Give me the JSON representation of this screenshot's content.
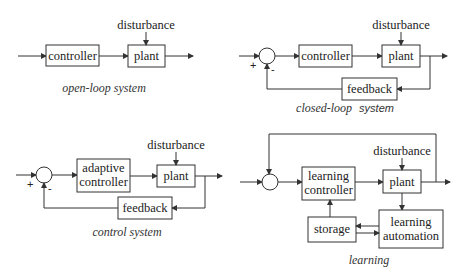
{
  "diagrams": {
    "open_loop": {
      "caption": "open-loop system",
      "blocks": {
        "controller": "controller",
        "plant": "plant"
      },
      "disturbance": "disturbance"
    },
    "closed_loop": {
      "caption_a": "closed-loop",
      "caption_b": "system",
      "blocks": {
        "controller": "controller",
        "plant": "plant",
        "feedback": "feedback"
      },
      "disturbance": "disturbance",
      "signs": {
        "plus": "+",
        "minus": "-"
      }
    },
    "adaptive": {
      "caption": "control system",
      "blocks": {
        "controller_line1": "adaptive",
        "controller_line2": "controller",
        "plant": "plant",
        "feedback": "feedback"
      },
      "disturbance": "disturbance",
      "signs": {
        "plus": "+",
        "minus": "-"
      }
    },
    "learning": {
      "caption": "learning",
      "blocks": {
        "controller_line1": "learning",
        "controller_line2": "controller",
        "plant": "plant",
        "storage": "storage",
        "automation_line1": "learning",
        "automation_line2": "automation"
      },
      "disturbance": "disturbance"
    }
  },
  "colors": {
    "stroke": "#333333",
    "text": "#222222",
    "background": "#ffffff"
  }
}
